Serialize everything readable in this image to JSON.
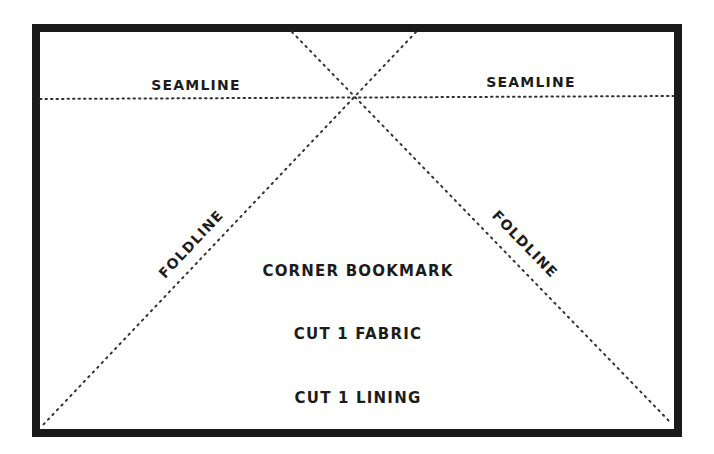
{
  "diagram": {
    "type": "sewing-pattern",
    "border": {
      "x": 32,
      "y": 24,
      "width": 650,
      "height": 413,
      "stroke": 8,
      "color": "#1a1a1a"
    },
    "line_color": "#333333",
    "seamline": {
      "label_left": "SEAMLINE",
      "label_right": "SEAMLINE"
    },
    "foldline": {
      "label_left": "FOLDLINE",
      "label_right": "FOLDLINE"
    },
    "piece": {
      "title": "CORNER BOOKMARK",
      "cut_fabric": "CUT 1 FABRIC",
      "cut_lining": "CUT 1 LINING"
    }
  }
}
